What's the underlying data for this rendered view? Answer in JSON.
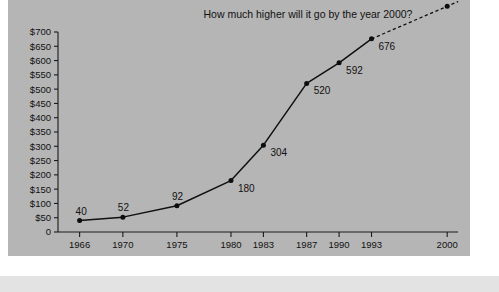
{
  "figure": {
    "panel_color": "#b5b5b5",
    "footer_band_color": "#e3e3e3",
    "page_background": "#ffffff"
  },
  "chart_data": {
    "type": "line",
    "title": "How much higher will it go by the year 2000?",
    "xlabel": "",
    "ylabel": "",
    "grid": false,
    "legend": "none",
    "line_color": "#101010",
    "marker_color": "#0d0d0d",
    "axis_color": "#1a1a1a",
    "x": [
      1966,
      1970,
      1975,
      1980,
      1983,
      1987,
      1990,
      1993,
      2000
    ],
    "categories": [
      "1966",
      "1970",
      "1975",
      "1980",
      "1983",
      "1987",
      "1990",
      "1993",
      "2000"
    ],
    "values": [
      40,
      52,
      92,
      180,
      304,
      520,
      592,
      676,
      790
    ],
    "point_labels": [
      "40",
      "52",
      "92",
      "180",
      "304",
      "520",
      "592",
      "676",
      ""
    ],
    "projected_from_index": 7,
    "projected_note": "dashed segment from 1993 to 2000 and beyond",
    "xlim": [
      1964,
      2001
    ],
    "ylim": [
      0,
      700
    ],
    "ytick_values": [
      0,
      50,
      100,
      150,
      200,
      250,
      300,
      350,
      400,
      450,
      500,
      550,
      600,
      650,
      700
    ],
    "ytick_labels": [
      "0",
      "$50",
      "$100",
      "$150",
      "$200",
      "$250",
      "$300",
      "$350",
      "$400",
      "$450",
      "$500",
      "$550",
      "$600",
      "$650",
      "$700"
    ],
    "xtick_values": [
      1966,
      1970,
      1975,
      1980,
      1983,
      1987,
      1990,
      1993,
      2000
    ],
    "xtick_labels": [
      "1966",
      "1970",
      "1975",
      "1980",
      "1983",
      "1987",
      "1990",
      "1993",
      "2000"
    ]
  }
}
